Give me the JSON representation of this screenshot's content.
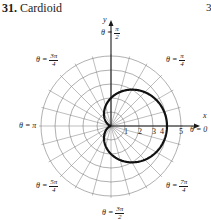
{
  "header": {
    "exercise_number": "31.",
    "title": "Cardioid",
    "page_fragment": "3"
  },
  "axes": {
    "x_label": "x",
    "y_label": "y",
    "ticks": [
      "1",
      "2",
      "3",
      "4",
      "5"
    ]
  },
  "angle_labels": {
    "theta0": {
      "prefix": "θ = 0"
    },
    "pi_over_2": {
      "prefix": "θ =",
      "num": "π",
      "den": "2"
    },
    "pi_over_4": {
      "prefix": "θ =",
      "num": "π",
      "den": "4"
    },
    "three_pi_over_4": {
      "prefix": "θ =",
      "num": "3π",
      "den": "4"
    },
    "pi": {
      "prefix": "θ = π"
    },
    "five_pi_over_4": {
      "prefix": "θ =",
      "num": "5π",
      "den": "4"
    },
    "three_pi_over_2": {
      "prefix": "θ =",
      "num": "3π",
      "den": "2"
    },
    "seven_pi_over_4": {
      "prefix": "θ =",
      "num": "7π",
      "den": "4"
    }
  },
  "chart_data": {
    "type": "polar",
    "title": "Cardioid",
    "equation": "r = 2 + 2cos θ",
    "r_ticks": [
      1,
      2,
      3,
      4,
      5
    ],
    "r_max": 5,
    "angle_labels": [
      "0",
      "π/4",
      "π/2",
      "3π/4",
      "π",
      "5π/4",
      "3π/2",
      "7π/4"
    ],
    "radial_lines_every_deg": 15,
    "curve_points": [
      {
        "theta": "0",
        "r": 4
      },
      {
        "theta": "π/2",
        "r": 2
      },
      {
        "theta": "π",
        "r": 0
      },
      {
        "theta": "3π/2",
        "r": 2
      }
    ]
  }
}
